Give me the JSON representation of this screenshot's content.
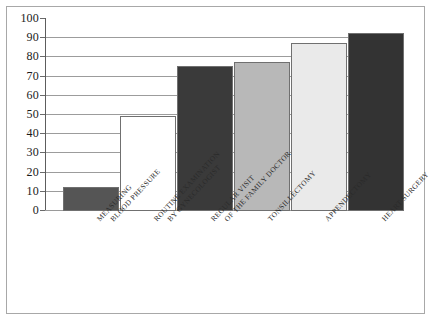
{
  "chart_data": {
    "type": "bar",
    "title": "",
    "subtitle": "",
    "xlabel": "",
    "ylabel": "",
    "ylim": [
      0,
      100
    ],
    "ytick_step": 10,
    "yticks": [
      100,
      90,
      80,
      70,
      60,
      50,
      40,
      30,
      20,
      10,
      0
    ],
    "ytick_labels": [
      "100",
      "90",
      "80",
      "70",
      "60",
      "50",
      "40",
      "30",
      "20",
      "10",
      "0"
    ],
    "grid": "horizontal",
    "legend": "none",
    "categories": [
      "MEASURING BLOOD PRESSURE",
      "ROUTINE EXAMINATION BY GYNECOLOGIST",
      "REGULAR VISIT OF THE FAMILY DOCTOR",
      "TONSILLECTOMY",
      "APPENDECTOMY",
      "HEART SURGERY"
    ],
    "category_lines": [
      [
        "MEASURING",
        "BLOOD PRESSURE"
      ],
      [
        "ROUTINE EXAMINATION",
        "BY GYNECOLOGIST"
      ],
      [
        "REGULAR VISIT",
        "OF THE FAMILY DOCTOR"
      ],
      [
        "TONSILLECTOMY",
        ""
      ],
      [
        "APPENDECTOMY",
        ""
      ],
      [
        "HEART SURGERY",
        ""
      ]
    ],
    "values": [
      12,
      49,
      75,
      77,
      87,
      92
    ],
    "bar_colors": [
      "#555555",
      "#ffffff",
      "#3a3a3a",
      "#b8b8b8",
      "#eaeaea",
      "#333333"
    ],
    "bar_border_color": "#707070",
    "grid_color": "#9c9c9c",
    "axis_color": "#5d5d5d",
    "frame_color": "#a8a8a8",
    "background": "#ffffff"
  }
}
